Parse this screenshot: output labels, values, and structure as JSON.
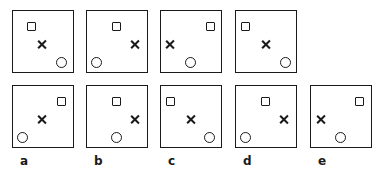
{
  "figure": {
    "top_row": [
      {
        "square": [
          0.3,
          0.25
        ],
        "cross": [
          0.47,
          0.54
        ],
        "circle": [
          0.78,
          0.82
        ]
      },
      {
        "square": [
          0.48,
          0.25
        ],
        "cross": [
          0.78,
          0.54
        ],
        "circle": [
          0.16,
          0.82
        ]
      },
      {
        "square": [
          0.8,
          0.25
        ],
        "cross": [
          0.14,
          0.54
        ],
        "circle": [
          0.48,
          0.82
        ]
      },
      {
        "square": [
          0.16,
          0.25
        ],
        "cross": [
          0.48,
          0.54
        ],
        "circle": [
          0.8,
          0.82
        ]
      }
    ],
    "options": [
      {
        "label": "a",
        "square": [
          0.78,
          0.25
        ],
        "cross": [
          0.47,
          0.54
        ],
        "circle": [
          0.16,
          0.82
        ]
      },
      {
        "label": "b",
        "square": [
          0.48,
          0.25
        ],
        "cross": [
          0.78,
          0.54
        ],
        "circle": [
          0.47,
          0.82
        ]
      },
      {
        "label": "c",
        "square": [
          0.16,
          0.25
        ],
        "cross": [
          0.48,
          0.54
        ],
        "circle": [
          0.78,
          0.82
        ]
      },
      {
        "label": "d",
        "square": [
          0.48,
          0.25
        ],
        "cross": [
          0.78,
          0.54
        ],
        "circle": [
          0.16,
          0.82
        ]
      },
      {
        "label": "e",
        "square": [
          0.78,
          0.25
        ],
        "cross": [
          0.16,
          0.54
        ],
        "circle": [
          0.47,
          0.82
        ]
      }
    ]
  }
}
